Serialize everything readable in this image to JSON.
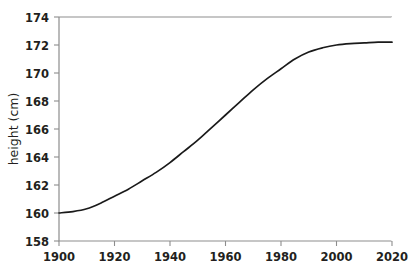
{
  "chart_data": {
    "type": "line",
    "title": "",
    "subtitle": "",
    "xlabel": "",
    "ylabel": "height (cm)",
    "xlim": [
      1900,
      2020
    ],
    "ylim": [
      158,
      174
    ],
    "xticks": [
      1900,
      1920,
      1940,
      1960,
      1980,
      2000,
      2020
    ],
    "xtick_labels": [
      "1900",
      "1920",
      "1940",
      "1960",
      "1980",
      "2000",
      "2020"
    ],
    "yticks": [
      158,
      160,
      162,
      164,
      166,
      168,
      170,
      172,
      174
    ],
    "ytick_labels": [
      "158",
      "160",
      "162",
      "164",
      "166",
      "168",
      "170",
      "172",
      "174"
    ],
    "grid": false,
    "legend": null,
    "legend_position": "none",
    "annotations": [],
    "series": [
      {
        "name": "height",
        "color": "#1a1a1a",
        "line_width": 1.7,
        "marker": "none",
        "x": [
          1900,
          1905,
          1910,
          1915,
          1920,
          1925,
          1930,
          1935,
          1940,
          1945,
          1950,
          1955,
          1960,
          1965,
          1970,
          1975,
          1980,
          1985,
          1990,
          1995,
          2000,
          2005,
          2010,
          2015,
          2020
        ],
        "y": [
          160.0,
          160.1,
          160.3,
          160.7,
          161.2,
          161.7,
          162.3,
          162.9,
          163.6,
          164.4,
          165.2,
          166.1,
          167.0,
          167.9,
          168.8,
          169.6,
          170.3,
          171.0,
          171.5,
          171.8,
          172.0,
          172.1,
          172.15,
          172.2,
          172.2
        ]
      }
    ]
  },
  "axes": {
    "ylabel_text": "height (cm)"
  }
}
